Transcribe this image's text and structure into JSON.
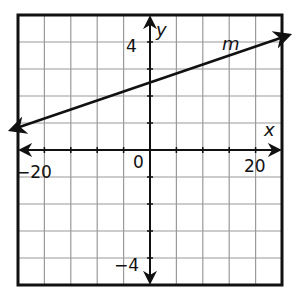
{
  "chart_data": {
    "type": "line",
    "title": "",
    "xlabel": "x",
    "ylabel": "y",
    "xlim": [
      -20,
      20
    ],
    "ylim": [
      -5,
      5
    ],
    "grid": true,
    "grid_x_step": 4,
    "grid_y_step": 1,
    "x_tick_labels": [
      "-20",
      "0",
      "20"
    ],
    "y_tick_labels": [
      "4",
      "-4"
    ],
    "series": [
      {
        "name": "m",
        "x": [
          -21,
          21
        ],
        "y": [
          0.75,
          4.25
        ],
        "slope": 0.0833,
        "y_intercept": 2.5,
        "arrows": "both"
      }
    ],
    "annotations": [
      {
        "text": "m",
        "x": 14,
        "y": 4.5
      }
    ]
  },
  "labels": {
    "x_axis": "x",
    "y_axis": "y",
    "x_min": "−20",
    "x_max": "20",
    "origin": "0",
    "y_max": "4",
    "y_min": "−4",
    "line_name": "m"
  },
  "colors": {
    "grid": "#9a9a9a",
    "frame": "#111111",
    "line": "#111111"
  }
}
